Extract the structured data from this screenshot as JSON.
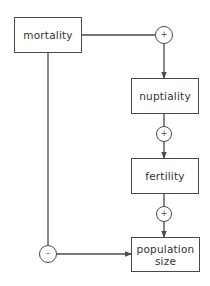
{
  "nodes": {
    "mortality": {
      "label": "mortality"
    },
    "nuptiality": {
      "label": "nuptiality"
    },
    "fertility": {
      "label": "fertility"
    },
    "population_size": {
      "label_line1": "population",
      "label_line2": "size"
    }
  },
  "edges": [
    {
      "from": "mortality",
      "to": "nuptiality",
      "sign": "+"
    },
    {
      "from": "nuptiality",
      "to": "fertility",
      "sign": "+"
    },
    {
      "from": "fertility",
      "to": "population_size",
      "sign": "+"
    },
    {
      "from": "mortality",
      "to": "population_size",
      "sign": "–"
    }
  ],
  "signs": {
    "mortality_nuptiality": "+",
    "nuptiality_fertility": "+",
    "fertility_population": "+",
    "mortality_population": "–"
  },
  "colors": {
    "line": "#4a4a4a",
    "background": "#ffffff"
  }
}
